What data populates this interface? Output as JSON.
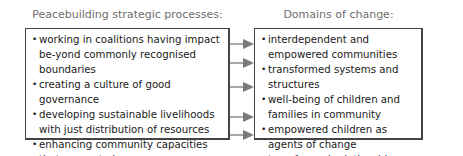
{
  "left": {
    "heading": "Peacebuilding strategic processes:",
    "items": [
      "working in coalitions having impact be-yond commonly recognised boundaries",
      "creating a culture of good governance",
      "developing sustainable livelihoods with just distribution of resources",
      "enhancing community capacities that generate hope",
      "transforming people"
    ]
  },
  "right": {
    "heading": "Domains of change:",
    "items": [
      "interdependent and empowered communities",
      "transformed systems and structures",
      "well-being of children and families in community",
      "empowered children as agents of change",
      "transformed relationships"
    ]
  },
  "colors": {
    "arrow": "#7a7a7a",
    "border": "#444444",
    "heading": "#6e6e6e"
  }
}
